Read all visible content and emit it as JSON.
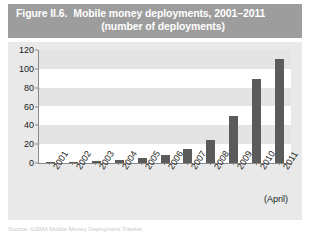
{
  "figure": {
    "number": "Figure II.6.",
    "title": "Mobile money deployments, 2001–2011",
    "subtitle": "(number of deployments)",
    "source_note": "Source: GSMA Mobile Money Deployment Tracker.",
    "axis_note": "(April)"
  },
  "colors": {
    "title_band": "#9d9d9d",
    "title_text": "#ffffff",
    "panel_background": "#e9e9e9",
    "plot_background": "#ffffff",
    "band_stripe": "#e4e4e4",
    "bar": "#5b5b5b",
    "axis": "#8a8a8a",
    "tick_text": "#1a1a1a"
  },
  "chart_data": {
    "type": "bar",
    "title": "Mobile money deployments, 2001–2011",
    "subtitle": "(number of deployments)",
    "xlabel": "",
    "ylabel": "",
    "categories": [
      "2001",
      "2002",
      "2003",
      "2004",
      "2005",
      "2006",
      "2007",
      "2008",
      "2009",
      "2010",
      "2011"
    ],
    "values": [
      1,
      1,
      2,
      3,
      5,
      8,
      15,
      24,
      50,
      89,
      110
    ],
    "ylim": [
      0,
      120
    ],
    "yticks": [
      0,
      20,
      40,
      60,
      80,
      100,
      120
    ],
    "ytick_labels": [
      "0",
      "20",
      "40",
      "60",
      "80",
      "100",
      "120"
    ],
    "grid": false,
    "banded_background": true,
    "legend": null,
    "annotations": [
      "(April)"
    ]
  }
}
